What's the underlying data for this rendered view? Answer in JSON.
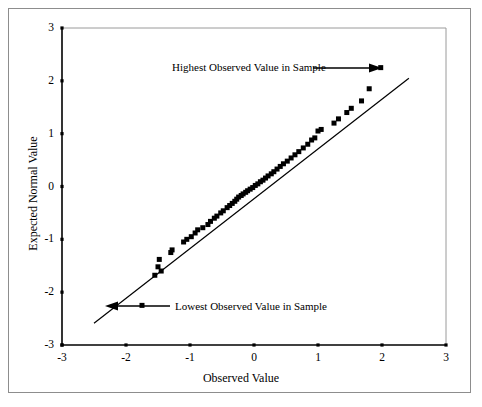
{
  "figure": {
    "border_color": "#8d8d8d",
    "background": "#ffffff"
  },
  "axes": {
    "x_title": "Observed Value",
    "y_title": "Expected Normal Value",
    "x_ticklabels": [
      "-3",
      "-2",
      "-1",
      "0",
      "1",
      "2",
      "3"
    ],
    "y_ticklabels": [
      "3",
      "2",
      "1",
      "0",
      "-1",
      "-2",
      "-3"
    ]
  },
  "annotations": [
    {
      "name": "highest-observed",
      "text": "Highest Observed Value in Sample",
      "arrow": "right"
    },
    {
      "name": "lowest-observed",
      "text": "Lowest Observed Value in Sample",
      "arrow": "left"
    }
  ],
  "chart_data": {
    "type": "scatter",
    "title": "",
    "subtitle": "",
    "xlabel": "Observed Value",
    "ylabel": "Expected Normal Value",
    "xlim": [
      -3,
      3
    ],
    "ylim": [
      -3,
      3
    ],
    "xticks": [
      -3,
      -2,
      -1,
      0,
      1,
      2,
      3
    ],
    "yticks": [
      -3,
      -2,
      -1,
      0,
      1,
      2,
      3
    ],
    "grid": false,
    "legend": "none",
    "marker": {
      "shape": "square",
      "color": "#000000",
      "size_px": 5
    },
    "reference_line": {
      "name": "normal-fit-line",
      "color": "#000000",
      "x": [
        -2.5,
        2.42
      ],
      "y": [
        -2.59,
        2.05
      ]
    },
    "series": [
      {
        "name": "Normal Q-Q points",
        "x": [
          -1.75,
          -1.55,
          -1.5,
          -1.48,
          -1.45,
          -1.3,
          -1.28,
          -1.1,
          -1.05,
          -0.98,
          -0.92,
          -0.88,
          -0.8,
          -0.72,
          -0.68,
          -0.62,
          -0.58,
          -0.52,
          -0.48,
          -0.42,
          -0.38,
          -0.34,
          -0.3,
          -0.27,
          -0.24,
          -0.2,
          -0.17,
          -0.13,
          -0.1,
          -0.06,
          -0.02,
          0.02,
          0.06,
          0.1,
          0.14,
          0.18,
          0.22,
          0.27,
          0.31,
          0.36,
          0.41,
          0.46,
          0.52,
          0.58,
          0.64,
          0.7,
          0.77,
          0.84,
          0.9,
          0.95,
          1.0,
          1.05,
          1.25,
          1.32,
          1.45,
          1.52,
          1.68,
          1.8,
          1.98
        ],
        "y": [
          -2.25,
          -1.68,
          -1.52,
          -1.38,
          -1.6,
          -1.25,
          -1.2,
          -1.05,
          -1.0,
          -0.95,
          -0.88,
          -0.82,
          -0.78,
          -0.72,
          -0.66,
          -0.6,
          -0.56,
          -0.5,
          -0.46,
          -0.4,
          -0.36,
          -0.32,
          -0.28,
          -0.24,
          -0.2,
          -0.17,
          -0.14,
          -0.11,
          -0.08,
          -0.05,
          -0.02,
          0.02,
          0.05,
          0.09,
          0.12,
          0.16,
          0.2,
          0.24,
          0.28,
          0.33,
          0.38,
          0.43,
          0.48,
          0.54,
          0.6,
          0.66,
          0.73,
          0.8,
          0.88,
          0.92,
          1.05,
          1.08,
          1.2,
          1.28,
          1.4,
          1.48,
          1.62,
          1.85,
          2.25
        ]
      }
    ]
  }
}
